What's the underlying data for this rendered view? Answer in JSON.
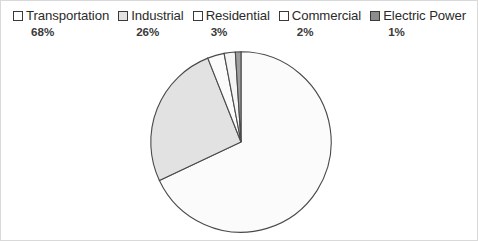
{
  "chart_data": {
    "type": "pie",
    "title": "",
    "categories": [
      "Transportation",
      "Industrial",
      "Residential",
      "Commercial",
      "Electric Power"
    ],
    "values": [
      68,
      26,
      3,
      2,
      1
    ],
    "value_labels": [
      "68%",
      "26%",
      "3%",
      "2%",
      "1%"
    ],
    "unit": "%",
    "total": 100,
    "start_angle_deg": 0,
    "direction": "clockwise",
    "legend_position": "top",
    "grid": false,
    "slice_colors": [
      "#fbfbfb",
      "#e2e2e2",
      "#fbfbfb",
      "#f5f5f5",
      "#9e9e9e"
    ],
    "slice_border_color": "#4a4a4a",
    "slices": [
      {
        "label": "Transportation",
        "value": 68,
        "value_label": "68%",
        "fill": "#fbfbfb",
        "swatch": "#ffffff"
      },
      {
        "label": "Industrial",
        "value": 26,
        "value_label": "26%",
        "fill": "#e2e2e2",
        "swatch": "#e2e2e2"
      },
      {
        "label": "Residential",
        "value": 3,
        "value_label": "3%",
        "fill": "#fbfbfb",
        "swatch": "#ffffff"
      },
      {
        "label": "Commercial",
        "value": 2,
        "value_label": "2%",
        "fill": "#f5f5f5",
        "swatch": "#ffffff"
      },
      {
        "label": "Electric Power",
        "value": 1,
        "value_label": "1%",
        "fill": "#9e9e9e",
        "swatch": "#8c8c8c"
      }
    ]
  },
  "legend": {
    "entries": [
      {
        "label": "Transportation",
        "value_label": "68%"
      },
      {
        "label": "Industrial",
        "value_label": "26%"
      },
      {
        "label": "Residential",
        "value_label": "3%"
      },
      {
        "label": "Commercial",
        "value_label": "2%"
      },
      {
        "label": "Electric Power",
        "value_label": "1%"
      }
    ]
  },
  "style": {
    "background": "#ffffff",
    "text_color": "#2b2b2b",
    "border_color": "#4a4a4a"
  }
}
